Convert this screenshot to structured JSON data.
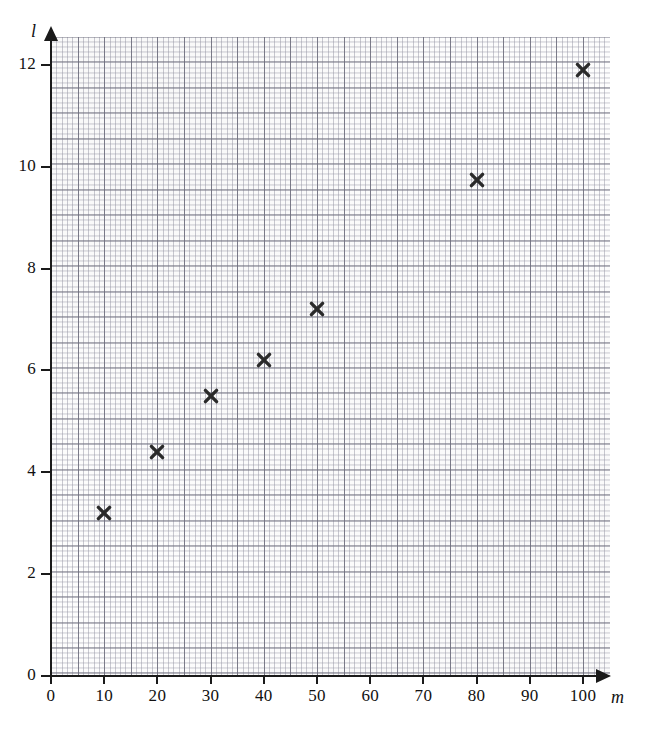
{
  "chart_data": {
    "type": "scatter",
    "title": "",
    "subtitle": "",
    "xlabel": "m",
    "ylabel": "l",
    "xlim": [
      0,
      105
    ],
    "ylim": [
      0,
      12.55
    ],
    "grid": true,
    "grid_style": "graph-paper, minor 1 m / 0.2 l, major every 5 minor",
    "legend": "none",
    "marker_style": "cross",
    "marker_color": "#2a2a2a",
    "xticks": [
      0,
      10,
      20,
      30,
      40,
      50,
      60,
      70,
      80,
      90,
      100
    ],
    "xtick_labels": [
      "0",
      "10",
      "20",
      "30",
      "40",
      "50",
      "60",
      "70",
      "80",
      "90",
      "100"
    ],
    "yticks": [
      0,
      2,
      4,
      6,
      8,
      10,
      12
    ],
    "ytick_labels": [
      "0",
      "2",
      "4",
      "6",
      "8",
      "10",
      "12"
    ],
    "points": [
      {
        "m": 10,
        "l": 3.2
      },
      {
        "m": 20,
        "l": 4.4
      },
      {
        "m": 30,
        "l": 5.5
      },
      {
        "m": 40,
        "l": 6.2
      },
      {
        "m": 50,
        "l": 7.2
      },
      {
        "m": 80,
        "l": 9.75
      },
      {
        "m": 100,
        "l": 11.9
      }
    ],
    "point_labels": [
      "(10, 3.2)",
      "(20, 4.4)",
      "(30, 5.5)",
      "(40, 6.2)",
      "(50, 7.2)",
      "(80, 9.75)",
      "(100, 11.9)"
    ],
    "axes": {
      "x_arrow": true,
      "y_arrow": true,
      "origin_label_x": "0",
      "origin_label_y": "0"
    },
    "colors": {
      "marker": "#2a2a2a",
      "axis": "#1a1a1a",
      "grid_major": "#6e6e7d",
      "grid_minor": "#9696a5",
      "background": "#ffffff",
      "paper": "#fdfdfd"
    }
  }
}
